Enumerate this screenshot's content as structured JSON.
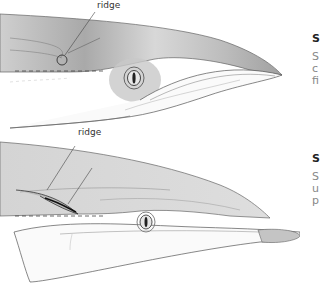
{
  "figure_top": {
    "label": "ridge",
    "caption_heading": "S",
    "caption_lines": [
      "S",
      "c",
      "fi"
    ]
  },
  "figure_bottom": {
    "label": "ridge",
    "caption_heading": "S",
    "caption_lines": [
      "S",
      "u",
      "p"
    ]
  },
  "colors": {
    "dorsal_shade": "#b8b8b8",
    "belly": "#ffffff",
    "outline": "#555555",
    "text_body": "#888888",
    "text_heading": "#222222"
  }
}
